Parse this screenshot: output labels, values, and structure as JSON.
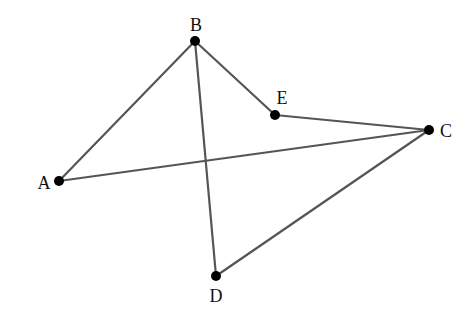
{
  "diagram": {
    "type": "geometry-figure",
    "canvas": {
      "width": 476,
      "height": 320,
      "background": "#ffffff"
    },
    "colors": {
      "edge": "#555555",
      "point": "#000000",
      "label": "#111111"
    },
    "points": [
      {
        "id": "A",
        "label": "A",
        "x": 59,
        "y": 181,
        "lx": 44,
        "ly": 189,
        "anchor": "middle"
      },
      {
        "id": "B",
        "label": "B",
        "x": 195,
        "y": 41,
        "lx": 196,
        "ly": 31,
        "anchor": "middle"
      },
      {
        "id": "C",
        "label": "C",
        "x": 429,
        "y": 130,
        "lx": 446,
        "ly": 137,
        "anchor": "middle"
      },
      {
        "id": "D",
        "label": "D",
        "x": 216,
        "y": 276,
        "lx": 216,
        "ly": 302,
        "anchor": "middle"
      },
      {
        "id": "E",
        "label": "E",
        "x": 275,
        "y": 115,
        "lx": 282,
        "ly": 104,
        "anchor": "middle"
      }
    ],
    "edges": [
      {
        "from": "A",
        "to": "B"
      },
      {
        "from": "B",
        "to": "E"
      },
      {
        "from": "E",
        "to": "C"
      },
      {
        "from": "A",
        "to": "C"
      },
      {
        "from": "B",
        "to": "D"
      },
      {
        "from": "D",
        "to": "C"
      }
    ]
  }
}
